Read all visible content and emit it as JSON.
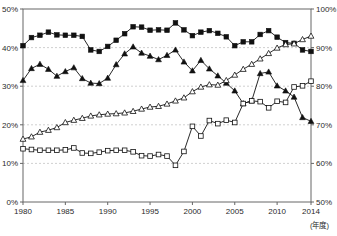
{
  "chart_data": {
    "type": "line",
    "title": "",
    "subtitle": "",
    "xlabel": "(年度)",
    "ylabel": "",
    "ylabel_right": "",
    "xlim": [
      1980,
      2014
    ],
    "ylim": [
      0,
      50
    ],
    "ylim_right": [
      50,
      100
    ],
    "grid": true,
    "legend_position": "none",
    "x": [
      1980,
      1981,
      1982,
      1983,
      1984,
      1985,
      1986,
      1987,
      1988,
      1989,
      1990,
      1991,
      1992,
      1993,
      1994,
      1995,
      1996,
      1997,
      1998,
      1999,
      2000,
      2001,
      2002,
      2003,
      2004,
      2005,
      2006,
      2007,
      2008,
      2009,
      2010,
      2011,
      2012,
      2013,
      2014
    ],
    "x_tick_labels": [
      "1980",
      "1985",
      "1990",
      "1995",
      "2000",
      "2005",
      "2010",
      "2014"
    ],
    "x_ticks": [
      1980,
      1985,
      1990,
      1995,
      2000,
      2005,
      2010,
      2014
    ],
    "y_tick_labels": [
      "0%",
      "10%",
      "20%",
      "30%",
      "40%",
      "50%"
    ],
    "y_ticks": [
      0,
      10,
      20,
      30,
      40,
      50
    ],
    "y_right_tick_labels": [
      "50%",
      "60%",
      "70%",
      "80%",
      "90%",
      "100%"
    ],
    "y_right_ticks": [
      50,
      60,
      70,
      80,
      90,
      100
    ],
    "series": [
      {
        "name": "series-filled-square",
        "marker": "filled-square",
        "axis": "left",
        "values": [
          40.5,
          42.6,
          43.2,
          44.0,
          43.3,
          43.2,
          43.2,
          42.9,
          39.4,
          39.0,
          40.3,
          41.9,
          43.6,
          45.4,
          45.3,
          44.5,
          44.6,
          44.5,
          46.4,
          44.6,
          43.1,
          44.0,
          44.4,
          43.7,
          42.8,
          40.5,
          41.5,
          41.5,
          43.4,
          44.4,
          42.7,
          41.3,
          41.1,
          39.4,
          39.0
        ]
      },
      {
        "name": "series-filled-triangle",
        "marker": "filled-triangle",
        "axis": "left",
        "values": [
          31.5,
          34.6,
          35.7,
          34.4,
          32.6,
          33.8,
          34.8,
          32.0,
          30.8,
          30.7,
          32.1,
          35.6,
          38.4,
          40.2,
          38.6,
          37.8,
          36.9,
          38.0,
          39.4,
          36.3,
          34.0,
          36.7,
          34.5,
          32.7,
          30.8,
          28.8,
          25.5,
          26.2,
          33.3,
          33.7,
          30.1,
          28.8,
          27.2,
          21.9,
          20.9
        ]
      },
      {
        "name": "series-open-triangle",
        "marker": "open-triangle",
        "axis": "left",
        "values": [
          16.3,
          16.9,
          18.1,
          18.6,
          19.3,
          20.6,
          21.2,
          21.7,
          22.3,
          22.6,
          22.8,
          22.9,
          23.1,
          23.5,
          24.1,
          24.6,
          24.8,
          25.4,
          26.2,
          27.0,
          28.6,
          29.8,
          30.4,
          30.3,
          31.5,
          32.9,
          34.4,
          35.7,
          37.1,
          38.5,
          39.9,
          40.8,
          41.0,
          42.1,
          43.0
        ]
      },
      {
        "name": "series-open-square",
        "marker": "open-square",
        "axis": "left",
        "values": [
          13.8,
          13.6,
          13.4,
          13.4,
          13.4,
          13.5,
          14.0,
          12.7,
          12.6,
          12.9,
          13.3,
          13.4,
          13.4,
          13.0,
          12.0,
          11.9,
          12.3,
          11.9,
          9.5,
          13.1,
          19.6,
          17.1,
          21.1,
          20.3,
          21.2,
          20.6,
          25.5,
          26.2,
          26.0,
          24.4,
          26.1,
          25.8,
          29.8,
          30.1,
          31.3
        ]
      }
    ],
    "annotations": []
  }
}
